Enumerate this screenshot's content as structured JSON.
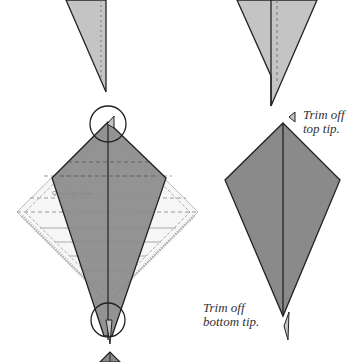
{
  "figure": {
    "colors": {
      "background": "#ffffff",
      "light_fabric": "#c4c4c4",
      "dark_fabric": "#8a8a8a",
      "outline": "#222222",
      "ruler": "#f4f4f4",
      "ruler_line": "#999999"
    }
  },
  "labels": {
    "trim_top_line1": "Trim off",
    "trim_top_line2": "top tip.",
    "trim_bottom_line1": "Trim off",
    "trim_bottom_line2": "bottom tip."
  },
  "ruler": {
    "brand_text": "Quick Qtr Ruler"
  }
}
